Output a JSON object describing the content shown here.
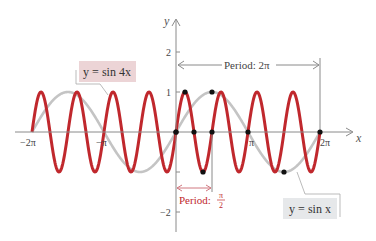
{
  "chart_data": {
    "type": "line",
    "title": "",
    "xlabel": "x",
    "ylabel": "y",
    "xlim": [
      -6.2832,
      6.2832
    ],
    "ylim": [
      -2,
      2
    ],
    "grid": false,
    "x_ticks": [
      {
        "value": -6.2832,
        "label": "−2π"
      },
      {
        "value": -3.1416,
        "label": "−π"
      },
      {
        "value": 3.1416,
        "label": "π"
      },
      {
        "value": 6.2832,
        "label": "2π"
      }
    ],
    "y_ticks": [
      {
        "value": 2,
        "label": "2"
      },
      {
        "value": 1,
        "label": "1"
      },
      {
        "value": -1,
        "label": ""
      },
      {
        "value": -2,
        "label": "−2"
      }
    ],
    "series": [
      {
        "name": "y = sin 4x",
        "function": "sin(4x)",
        "color": "#c0282d",
        "period": "π/2",
        "domain": [
          -6.2832,
          6.2832
        ]
      },
      {
        "name": "y = sin x",
        "function": "sin(x)",
        "color": "#c4c4c4",
        "period": "2π",
        "domain": [
          -6.2832,
          6.2832
        ]
      }
    ],
    "key_points_sin4x": [
      {
        "x": 0,
        "y": 0
      },
      {
        "x": 0.3927,
        "y": 1
      },
      {
        "x": 0.7854,
        "y": 0
      },
      {
        "x": 1.1781,
        "y": -1
      },
      {
        "x": 1.5708,
        "y": 0
      }
    ],
    "key_points_sinx": [
      {
        "x": 0,
        "y": 0
      },
      {
        "x": 1.5708,
        "y": 1
      },
      {
        "x": 3.1416,
        "y": 0
      },
      {
        "x": 4.7124,
        "y": -1
      },
      {
        "x": 6.2832,
        "y": 0
      }
    ],
    "annotations": [
      {
        "text": "Period: 2π",
        "type": "bracket-arrow",
        "from": 0,
        "to": 6.2832,
        "color": "#555555"
      },
      {
        "text": "Period: π/2",
        "type": "bracket-arrow",
        "from": 0,
        "to": 1.5708,
        "color": "#c0282d"
      },
      {
        "text": "y = sin 4x",
        "type": "callout-label",
        "bg": "#ecd4d6"
      },
      {
        "text": "y = sin x",
        "type": "callout-label",
        "bg": "#e6e8ea"
      }
    ]
  },
  "labels": {
    "y_axis": "y",
    "x_axis": "x",
    "tick_neg2pi": "−2π",
    "tick_negpi": "−π",
    "tick_pi": "π",
    "tick_2pi": "2π",
    "tick_y2": "2",
    "tick_y1": "1",
    "tick_yneg2": "−2",
    "period_big": "Period:  2π",
    "period_small_prefix": "Period:",
    "period_small_num": "π",
    "period_small_den": "2",
    "callout_sin4x": "y = sin 4x",
    "callout_sinx": "y = sin x"
  },
  "colors": {
    "red": "#c0282d",
    "gray_curve": "#c4c4c4",
    "axis": "#8a8a8a",
    "callout_red_bg": "#ecd4d6",
    "callout_gray_bg": "#e6e8ea"
  }
}
